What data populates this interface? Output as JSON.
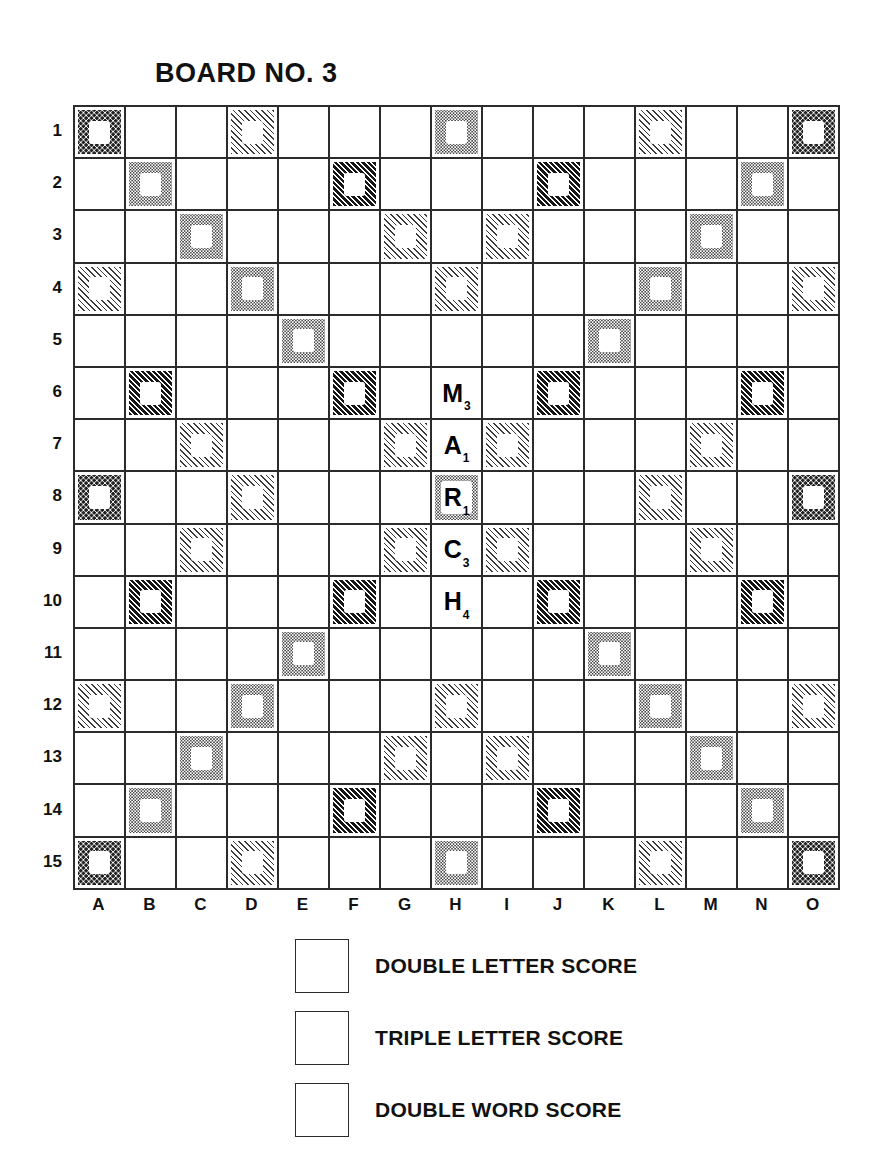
{
  "title": "BOARD NO. 3",
  "board": {
    "columns": [
      "A",
      "B",
      "C",
      "D",
      "E",
      "F",
      "G",
      "H",
      "I",
      "J",
      "K",
      "L",
      "M",
      "N",
      "O"
    ],
    "rows": [
      "1",
      "2",
      "3",
      "4",
      "5",
      "6",
      "7",
      "8",
      "9",
      "10",
      "11",
      "12",
      "13",
      "14",
      "15"
    ],
    "square_types": {
      "tws": "triple-word-score",
      "dws": "double-word-score",
      "tls": "triple-letter-score",
      "dls": "double-letter-score",
      "plain": "plain-square"
    },
    "layout": [
      [
        "tws",
        "plain",
        "plain",
        "dls",
        "plain",
        "plain",
        "plain",
        "dws",
        "plain",
        "plain",
        "plain",
        "dls",
        "plain",
        "plain",
        "tws"
      ],
      [
        "plain",
        "dws",
        "plain",
        "plain",
        "plain",
        "tls",
        "plain",
        "plain",
        "plain",
        "tls",
        "plain",
        "plain",
        "plain",
        "dws",
        "plain"
      ],
      [
        "plain",
        "plain",
        "dws",
        "plain",
        "plain",
        "plain",
        "dls",
        "plain",
        "dls",
        "plain",
        "plain",
        "plain",
        "dws",
        "plain",
        "plain"
      ],
      [
        "dls",
        "plain",
        "plain",
        "dws",
        "plain",
        "plain",
        "plain",
        "dls",
        "plain",
        "plain",
        "plain",
        "dws",
        "plain",
        "plain",
        "dls"
      ],
      [
        "plain",
        "plain",
        "plain",
        "plain",
        "dws",
        "plain",
        "plain",
        "plain",
        "plain",
        "plain",
        "dws",
        "plain",
        "plain",
        "plain",
        "plain"
      ],
      [
        "plain",
        "tls",
        "plain",
        "plain",
        "plain",
        "tls",
        "plain",
        "plain",
        "plain",
        "tls",
        "plain",
        "plain",
        "plain",
        "tls",
        "plain"
      ],
      [
        "plain",
        "plain",
        "dls",
        "plain",
        "plain",
        "plain",
        "dls",
        "plain",
        "dls",
        "plain",
        "plain",
        "plain",
        "dls",
        "plain",
        "plain"
      ],
      [
        "tws",
        "plain",
        "plain",
        "dls",
        "plain",
        "plain",
        "plain",
        "dws",
        "plain",
        "plain",
        "plain",
        "dls",
        "plain",
        "plain",
        "tws"
      ],
      [
        "plain",
        "plain",
        "dls",
        "plain",
        "plain",
        "plain",
        "dls",
        "plain",
        "dls",
        "plain",
        "plain",
        "plain",
        "dls",
        "plain",
        "plain"
      ],
      [
        "plain",
        "tls",
        "plain",
        "plain",
        "plain",
        "tls",
        "plain",
        "plain",
        "plain",
        "tls",
        "plain",
        "plain",
        "plain",
        "tls",
        "plain"
      ],
      [
        "plain",
        "plain",
        "plain",
        "plain",
        "dws",
        "plain",
        "plain",
        "plain",
        "plain",
        "plain",
        "dws",
        "plain",
        "plain",
        "plain",
        "plain"
      ],
      [
        "dls",
        "plain",
        "plain",
        "dws",
        "plain",
        "plain",
        "plain",
        "dls",
        "plain",
        "plain",
        "plain",
        "dws",
        "plain",
        "plain",
        "dls"
      ],
      [
        "plain",
        "plain",
        "dws",
        "plain",
        "plain",
        "plain",
        "dls",
        "plain",
        "dls",
        "plain",
        "plain",
        "plain",
        "dws",
        "plain",
        "plain"
      ],
      [
        "plain",
        "dws",
        "plain",
        "plain",
        "plain",
        "tls",
        "plain",
        "plain",
        "plain",
        "tls",
        "plain",
        "plain",
        "plain",
        "dws",
        "plain"
      ],
      [
        "tws",
        "plain",
        "plain",
        "dls",
        "plain",
        "plain",
        "plain",
        "dws",
        "plain",
        "plain",
        "plain",
        "dls",
        "plain",
        "plain",
        "tws"
      ]
    ],
    "tiles": [
      {
        "square": "H6",
        "row": 6,
        "col": 8,
        "letter": "M",
        "points": "3"
      },
      {
        "square": "H7",
        "row": 7,
        "col": 8,
        "letter": "A",
        "points": "1"
      },
      {
        "square": "H8",
        "row": 8,
        "col": 8,
        "letter": "R",
        "points": "1"
      },
      {
        "square": "H9",
        "row": 9,
        "col": 8,
        "letter": "C",
        "points": "3"
      },
      {
        "square": "H10",
        "row": 10,
        "col": 8,
        "letter": "H",
        "points": "4"
      }
    ],
    "word_played": "MARCH"
  },
  "legend": [
    {
      "type": "dls",
      "label": "DOUBLE LETTER SCORE"
    },
    {
      "type": "tls",
      "label": "TRIPLE LETTER SCORE"
    },
    {
      "type": "dws",
      "label": "DOUBLE WORD SCORE"
    }
  ],
  "colors": {
    "ink": "#111111",
    "grid_line": "#2b2b2b",
    "background": "#ffffff"
  }
}
